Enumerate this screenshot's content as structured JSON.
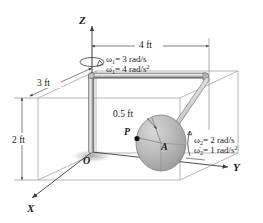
{
  "figure": {
    "axes": {
      "z_label": "Z",
      "x_label": "X",
      "y_label": "Y"
    },
    "points": {
      "origin_label": "O",
      "disk_center_label": "A",
      "disk_point_label": "P"
    },
    "dimensions": [
      {
        "id": "len-4ft",
        "text": "4 ft"
      },
      {
        "id": "len-3ft",
        "text": "3 ft"
      },
      {
        "id": "len-2ft",
        "text": "2 ft"
      },
      {
        "id": "radius-half-ft",
        "text": "0.5 ft"
      }
    ],
    "kinematics": {
      "omega1": {
        "symbol": "ω",
        "subscript": "1",
        "equals": "= 3 rad/s",
        "full": "ω₁ = 3 rad/s"
      },
      "alpha1": {
        "symbol": "ω̇",
        "subscript": "1",
        "equals": "= 4 rad/s",
        "superscript": "2",
        "full": "ω̇1 = 4 rad/s²"
      },
      "omega2": {
        "symbol": "ω",
        "subscript": "2",
        "equals": "= 2 rad/s",
        "full": "ω₂ = 2 rad/s"
      },
      "alpha2": {
        "symbol": "ω̇",
        "subscript": "2",
        "equals": "= 1 rad/s",
        "superscript": "2",
        "full": "ω̇2 = 1 rad/s²"
      }
    },
    "colors": {
      "wireframe": "#9a9a9a",
      "rod_light": "#f2f2f2",
      "rod_dark": "#6e6e6e",
      "disk_fill": "#b5b5b5",
      "disk_edge": "#7c7c7c",
      "text": "#1a1a1a",
      "background": "#ffffff"
    }
  }
}
